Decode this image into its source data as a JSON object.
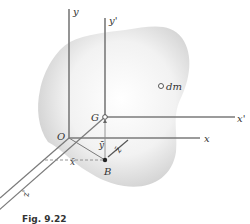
{
  "figure": {
    "caption": "Fig. 9.22",
    "labels": {
      "y": "y",
      "y_prime": "y'",
      "x": "x",
      "x_prime": "x'",
      "z": "z",
      "z_prime": "z'",
      "origin": "O",
      "centroid": "G",
      "point_b": "B",
      "mass_element": "dm",
      "x_bar": "x̄",
      "y_bar": "ȳ",
      "z_bar": "z̄"
    },
    "colors": {
      "axis": "#7a7a7a",
      "body_shade": "#cfcfcf",
      "text": "#333333",
      "background": "#ffffff"
    }
  }
}
